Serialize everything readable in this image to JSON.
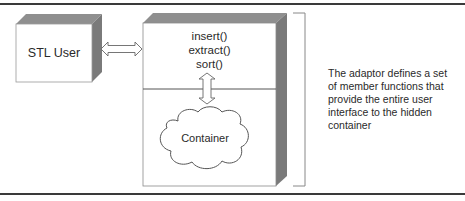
{
  "diagram": {
    "stl_user": {
      "label": "STL User"
    },
    "adaptor": {
      "methods": [
        "insert()",
        "extract()",
        "sort()"
      ]
    },
    "container": {
      "label": "Container"
    },
    "annotation": {
      "text": "The adaptor defines a set of member functions that provide the entire user interface to the hidden container"
    },
    "colors": {
      "box_face": "#ffffff",
      "box_top_bevel": "#8f8f8f",
      "box_side_bevel": "#7a7a7a",
      "outline": "#555555",
      "rule": "#3a3a3a",
      "bracket": "#888888"
    }
  }
}
